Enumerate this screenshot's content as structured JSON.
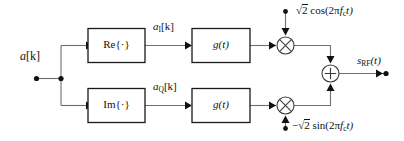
{
  "diagram": {
    "canvas": {
      "width": 404,
      "height": 141,
      "background": "#ffffff"
    },
    "colors": {
      "wire": "#6f6f6f",
      "box_stroke": "#1a1a1a",
      "text": "#111111",
      "circle_stroke": "#3a3a3a",
      "background": "#ffffff"
    },
    "input": {
      "label": "a[k]",
      "label_base": "a",
      "label_bracket": "[k]"
    },
    "blocks": {
      "real_part": "Re{·}",
      "imag_part": "Im{·}",
      "pulse_shape_i": "g(t)",
      "pulse_shape_q": "g(t)"
    },
    "signals": {
      "inphase_symbols_base": "a",
      "inphase_symbols_sub": "I",
      "inphase_symbols_tail": "[k]",
      "inphase_symbols": "aI[k]",
      "quadrature_symbols_base": "a",
      "quadrature_symbols_sub": "Q",
      "quadrature_symbols_tail": "[k]",
      "quadrature_symbols": "aQ[k]"
    },
    "carriers": {
      "cosine": "√2 cos(2πfct)",
      "cosine_coef": "2",
      "cosine_body": "cos(2π",
      "cosine_fc": "f",
      "cosine_fc_sub": "c",
      "cosine_tail": "t)",
      "sine": "−√2 sin(2πfct)",
      "sine_sign": "−",
      "sine_coef": "2",
      "sine_body": "sin(2π",
      "sine_fc": "f",
      "sine_fc_sub": "c",
      "sine_tail": "t)"
    },
    "operators": {
      "multiply": "×",
      "sum": "+"
    },
    "output": {
      "label": "sRF(t)",
      "label_base": "s",
      "label_sub": "RF",
      "label_tail": "(t)"
    }
  }
}
